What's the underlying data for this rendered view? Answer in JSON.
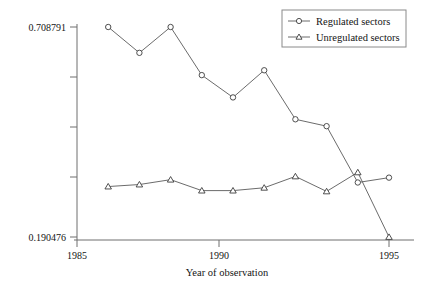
{
  "chart_data": {
    "type": "line",
    "title": "",
    "xlabel": "Year of observation",
    "ylabel": "",
    "xlim": [
      1985,
      1995.4
    ],
    "ylim": [
      0.190476,
      0.708791
    ],
    "grid": false,
    "legend_position": "top-right",
    "x_tick_labels": [
      "1985",
      "1990",
      "1995"
    ],
    "x_ticks": [
      1985,
      1990,
      1995
    ],
    "y_tick_labels": [
      "0.708791",
      "",
      "",
      "",
      "0.190476"
    ],
    "y_ticks": [
      0.708791,
      0.579212,
      0.449634,
      0.320055,
      0.190476
    ],
    "x": [
      1986,
      1987,
      1988,
      1989,
      1990,
      1991,
      1992,
      1993,
      1994,
      1995
    ],
    "series": [
      {
        "name": "Regulated sectors",
        "marker": "circle",
        "values": [
          0.708791,
          0.645,
          0.708791,
          0.59,
          0.535,
          0.602,
          0.481,
          0.464,
          0.325,
          0.337
        ]
      },
      {
        "name": "Unregulated sectors",
        "marker": "triangle",
        "values": [
          0.315,
          0.32,
          0.332,
          0.305,
          0.305,
          0.312,
          0.34,
          0.303,
          0.35,
          0.190476
        ]
      }
    ]
  },
  "axes": {
    "x_axis_label": "Year of observation",
    "x_tick_1": "1985",
    "x_tick_2": "1990",
    "x_tick_3": "1995",
    "y_tick_top": "0.708791",
    "y_tick_bottom": "0.190476"
  },
  "legend": {
    "entries": [
      {
        "label": "Regulated sectors",
        "marker": "circle-marker"
      },
      {
        "label": "Unregulated sectors",
        "marker": "triangle-marker"
      }
    ]
  },
  "colors": {
    "line": "#5a5a5a",
    "axis": "#6e6e6e",
    "marker_stroke": "#3c3c3c",
    "marker_fill": "#ffffff",
    "text": "#141414",
    "background": "#ffffff"
  }
}
